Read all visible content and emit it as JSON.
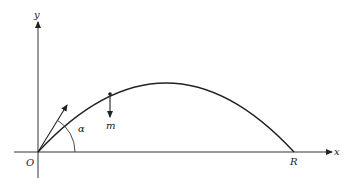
{
  "diagram": {
    "labels": {
      "y_axis": "y",
      "x_axis": "x",
      "origin": "O",
      "range": "R",
      "mass": "m",
      "angle": "α"
    },
    "colors": {
      "line": "#222222",
      "background": "#ffffff"
    }
  }
}
